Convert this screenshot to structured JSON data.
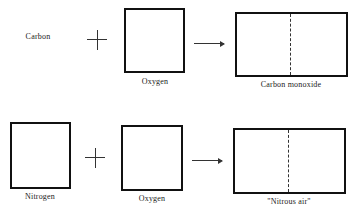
{
  "diagram": {
    "rows": [
      {
        "reactant1": {
          "label": "Carbon",
          "shape": "none"
        },
        "operator": "plus",
        "reactant2": {
          "label": "Oxygen",
          "shape": "square"
        },
        "arrow": "right-arrow",
        "product": {
          "label": "Carbon monoxide",
          "shape": "rectangle-split-dashed"
        }
      },
      {
        "reactant1": {
          "label": "Nitrogen",
          "shape": "square"
        },
        "operator": "plus",
        "reactant2": {
          "label": "Oxygen",
          "shape": "square"
        },
        "arrow": "right-arrow",
        "product": {
          "label": "\"Nitrous air\"",
          "shape": "rectangle-split-dashed"
        }
      }
    ]
  }
}
